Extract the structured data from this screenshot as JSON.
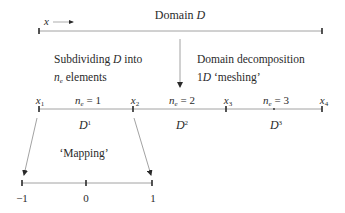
{
  "colors": {
    "line": "#8a8a8a",
    "tick": "#2a2a2a",
    "text": "#2a2a2a"
  },
  "domain": {
    "title": "Domain",
    "title_symbol": "D",
    "coord_label": "x"
  },
  "annotations": {
    "left_line1_pre": "Subdividing",
    "left_line1_sym": "D",
    "left_line1_post": "into",
    "left_line2_sym": "n",
    "left_line2_sub": "e",
    "left_line2_post": "elements",
    "right_line1": "Domain decomposition",
    "right_line2_pre": "1",
    "right_line2_sym": "D",
    "right_line2_post": "‘meshing’",
    "mapping": "‘Mapping’"
  },
  "nodes": [
    {
      "sym": "x",
      "sub": "1"
    },
    {
      "sym": "x",
      "sub": "2"
    },
    {
      "sym": "x",
      "sub": "3"
    },
    {
      "sym": "x",
      "sub": "4"
    }
  ],
  "elements": [
    {
      "n_sym": "n",
      "n_sub": "e",
      "n_eq": "= 1",
      "d_sym": "D",
      "d_sup": "1"
    },
    {
      "n_sym": "n",
      "n_sub": "e",
      "n_eq": "= 2",
      "d_sym": "D",
      "d_sup": "2"
    },
    {
      "n_sym": "n",
      "n_sub": "e",
      "n_eq": "= 3",
      "d_sym": "D",
      "d_sup": "3"
    }
  ],
  "reference_element": {
    "ticks": [
      "−1",
      "0",
      "1"
    ]
  }
}
